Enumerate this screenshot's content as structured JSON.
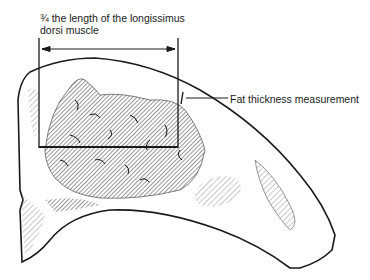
{
  "labels": {
    "length_line1": "¾ the length of the longissimus",
    "length_line2": "dorsi muscle",
    "fat": "Fat thickness measurement"
  },
  "colors": {
    "ink": "#1a1a1a",
    "hatch": "#555555",
    "background": "#ffffff"
  }
}
